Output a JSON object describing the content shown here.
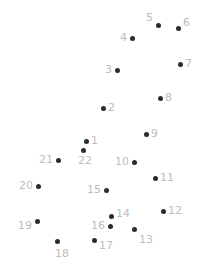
{
  "page": {
    "background_color": "#ffffff",
    "width": 205,
    "height": 277
  },
  "style": {
    "dot_color": "#2b2b2b",
    "label_color": "#bdbdbd",
    "dot_diameter": 5,
    "label_font_size": 11
  },
  "chart_data": {
    "type": "scatter",
    "xlabel": "",
    "ylabel": "",
    "xlim": [
      0,
      205
    ],
    "ylim": [
      0,
      277
    ],
    "grid": false,
    "legend": "none",
    "point_count": 22,
    "labels": [
      "1",
      "2",
      "3",
      "4",
      "5",
      "6",
      "7",
      "8",
      "9",
      "10",
      "11",
      "12",
      "13",
      "14",
      "15",
      "16",
      "17",
      "18",
      "19",
      "20",
      "21",
      "22"
    ],
    "x": [
      86,
      103,
      117,
      132,
      158,
      178,
      180,
      160,
      146,
      134,
      155,
      163,
      134,
      111,
      106,
      110,
      94,
      57,
      37,
      38,
      58,
      83
    ],
    "y": [
      141,
      108,
      70,
      38,
      25,
      28,
      64,
      98,
      134,
      162,
      178,
      211,
      229,
      216,
      190,
      226,
      240,
      241,
      221,
      186,
      160,
      150
    ],
    "points": [
      {
        "n": "1",
        "x": 86,
        "y": 141,
        "label_x": 91,
        "label_y": 135,
        "label_align": "left"
      },
      {
        "n": "2",
        "x": 103,
        "y": 108,
        "label_x": 108,
        "label_y": 102,
        "label_align": "left"
      },
      {
        "n": "3",
        "x": 117,
        "y": 70,
        "label_x": 112,
        "label_y": 64,
        "label_align": "right"
      },
      {
        "n": "4",
        "x": 132,
        "y": 38,
        "label_x": 127,
        "label_y": 32,
        "label_align": "right"
      },
      {
        "n": "5",
        "x": 158,
        "y": 25,
        "label_x": 153,
        "label_y": 12,
        "label_align": "right"
      },
      {
        "n": "6",
        "x": 178,
        "y": 28,
        "label_x": 183,
        "label_y": 17,
        "label_align": "left"
      },
      {
        "n": "7",
        "x": 180,
        "y": 64,
        "label_x": 185,
        "label_y": 58,
        "label_align": "left"
      },
      {
        "n": "8",
        "x": 160,
        "y": 98,
        "label_x": 165,
        "label_y": 92,
        "label_align": "left"
      },
      {
        "n": "9",
        "x": 146,
        "y": 134,
        "label_x": 151,
        "label_y": 128,
        "label_align": "left"
      },
      {
        "n": "10",
        "x": 134,
        "y": 162,
        "label_x": 129,
        "label_y": 156,
        "label_align": "right"
      },
      {
        "n": "11",
        "x": 155,
        "y": 178,
        "label_x": 160,
        "label_y": 172,
        "label_align": "left"
      },
      {
        "n": "12",
        "x": 163,
        "y": 211,
        "label_x": 168,
        "label_y": 205,
        "label_align": "left"
      },
      {
        "n": "13",
        "x": 134,
        "y": 229,
        "label_x": 139,
        "label_y": 234,
        "label_align": "left"
      },
      {
        "n": "14",
        "x": 111,
        "y": 216,
        "label_x": 116,
        "label_y": 208,
        "label_align": "left"
      },
      {
        "n": "15",
        "x": 106,
        "y": 190,
        "label_x": 101,
        "label_y": 184,
        "label_align": "right"
      },
      {
        "n": "16",
        "x": 110,
        "y": 226,
        "label_x": 105,
        "label_y": 220,
        "label_align": "right"
      },
      {
        "n": "17",
        "x": 94,
        "y": 240,
        "label_x": 99,
        "label_y": 240,
        "label_align": "left"
      },
      {
        "n": "18",
        "x": 57,
        "y": 241,
        "label_x": 55,
        "label_y": 248,
        "label_align": "left"
      },
      {
        "n": "19",
        "x": 37,
        "y": 221,
        "label_x": 32,
        "label_y": 220,
        "label_align": "right"
      },
      {
        "n": "20",
        "x": 38,
        "y": 186,
        "label_x": 33,
        "label_y": 180,
        "label_align": "right"
      },
      {
        "n": "21",
        "x": 58,
        "y": 160,
        "label_x": 53,
        "label_y": 154,
        "label_align": "right"
      },
      {
        "n": "22",
        "x": 83,
        "y": 150,
        "label_x": 78,
        "label_y": 155,
        "label_align": "left"
      }
    ]
  }
}
